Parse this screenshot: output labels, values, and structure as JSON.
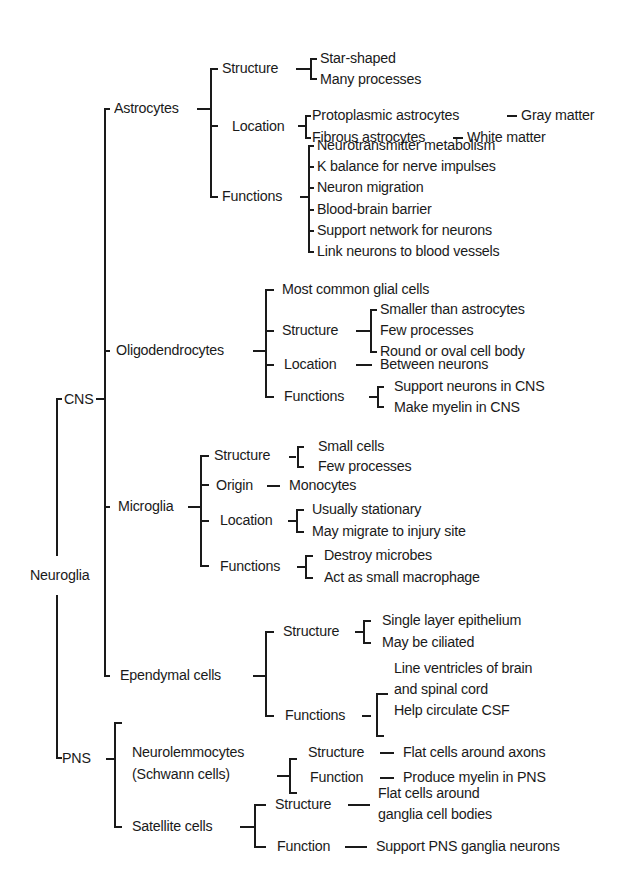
{
  "diagram": {
    "root": "Neuroglia",
    "cns": {
      "label": "CNS",
      "astrocytes": {
        "label": "Astrocytes",
        "structure": {
          "label": "Structure",
          "items": [
            "Star-shaped",
            "Many processes"
          ]
        },
        "location": {
          "label": "Location",
          "items": [
            {
              "type": "Protoplasmic astrocytes",
              "where": "Gray matter"
            },
            {
              "type": "Fibrous astrocytes",
              "where": "White matter"
            }
          ]
        },
        "functions": {
          "label": "Functions",
          "items": [
            "Neurotransmitter metabolism",
            "K  balance for nerve impulses",
            "Neuron migration",
            "Blood-brain barrier",
            "Support network for neurons",
            "Link neurons to blood vessels"
          ]
        }
      },
      "oligodendrocytes": {
        "label": "Oligodendrocytes",
        "note": "Most common glial cells",
        "structure": {
          "label": "Structure",
          "items": [
            "Smaller than astrocytes",
            "Few processes",
            "Round or oval cell body"
          ]
        },
        "location": {
          "label": "Location",
          "value": "Between neurons"
        },
        "functions": {
          "label": "Functions",
          "items": [
            "Support neurons in CNS",
            "Make myelin in CNS"
          ]
        }
      },
      "microglia": {
        "label": "Microglia",
        "structure": {
          "label": "Structure",
          "items": [
            "Small cells",
            "Few processes"
          ]
        },
        "origin": {
          "label": "Origin",
          "value": "Monocytes"
        },
        "location": {
          "label": "Location",
          "items": [
            "Usually stationary",
            "May migrate to injury site"
          ]
        },
        "functions": {
          "label": "Functions",
          "items": [
            "Destroy microbes",
            "Act as small macrophage"
          ]
        }
      },
      "ependymal": {
        "label": "Ependymal cells",
        "structure": {
          "label": "Structure",
          "items": [
            "Single layer epithelium",
            "May be ciliated"
          ]
        },
        "functions": {
          "label": "Functions",
          "items": [
            "Line ventricles of brain",
            "and spinal cord",
            "Help circulate CSF"
          ]
        }
      }
    },
    "pns": {
      "label": "PNS",
      "neurolemmocytes": {
        "label": "Neurolemmocytes",
        "alt": "(Schwann cells)",
        "structure": {
          "label": "Structure",
          "value": "Flat cells around axons"
        },
        "function": {
          "label": "Function",
          "value": "Produce myelin in PNS"
        }
      },
      "satellite": {
        "label": "Satellite cells",
        "structure": {
          "label": "Structure",
          "value": [
            "Flat cells around",
            "ganglia cell bodies"
          ]
        },
        "function": {
          "label": "Function",
          "value": "Support PNS ganglia neurons"
        }
      }
    }
  }
}
